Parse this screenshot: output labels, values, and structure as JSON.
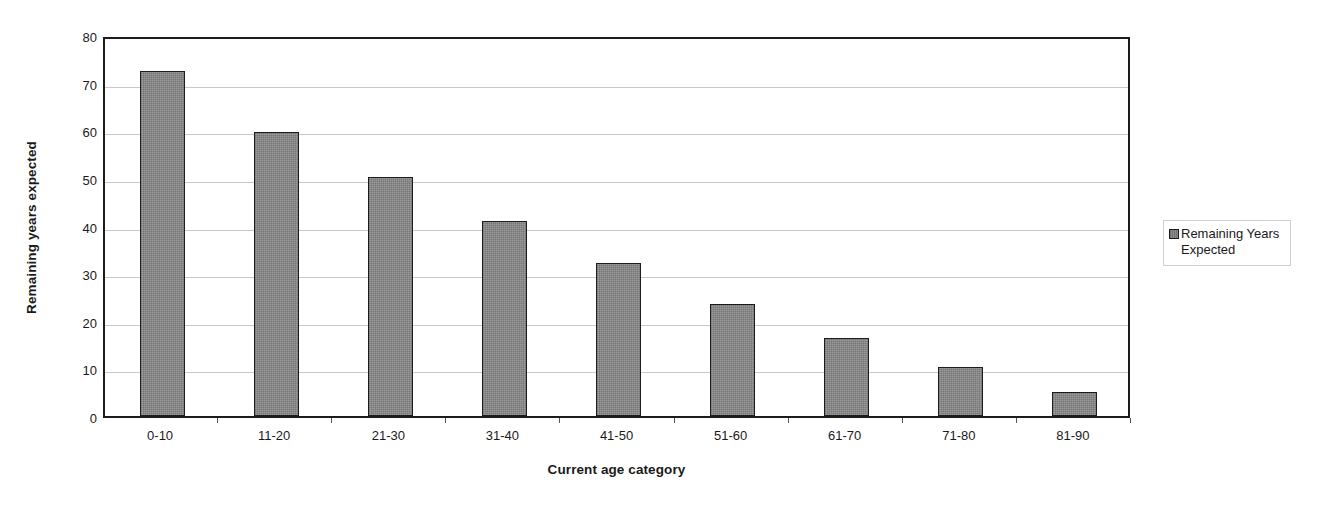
{
  "chart_data": {
    "type": "bar",
    "title": "",
    "categories": [
      "0-10",
      "11-20",
      "21-30",
      "31-40",
      "41-50",
      "51-60",
      "61-70",
      "71-80",
      "81-90"
    ],
    "values": [
      72.5,
      59.7,
      50.2,
      40.9,
      32.2,
      23.6,
      16.3,
      10.3,
      5.1
    ],
    "series": [
      {
        "name": "Remaining Years Expected",
        "values": [
          72.5,
          59.7,
          50.2,
          40.9,
          32.2,
          23.6,
          16.3,
          10.3,
          5.1
        ],
        "color": "#808080"
      }
    ],
    "xlabel": "Current age category",
    "ylabel": "Remaining years expected",
    "ylim": [
      0,
      80
    ],
    "ytick_step": 10,
    "yticks": [
      "80",
      "70",
      "60",
      "50",
      "40",
      "30",
      "20",
      "10",
      "0"
    ],
    "grid": true,
    "grid_axis": "y",
    "legend_position": "right",
    "legend_entries": [
      "Remaining Years Expected"
    ],
    "bar_fill_color": "#808080",
    "bar_border_color": "#1c1c1c",
    "gridline_color": "#c8c8c8",
    "axis_color": "#1c1c1c",
    "background_color": "#ffffff"
  },
  "legend": {
    "swatch_name": "series-swatch",
    "label": "Remaining Years Expected"
  }
}
